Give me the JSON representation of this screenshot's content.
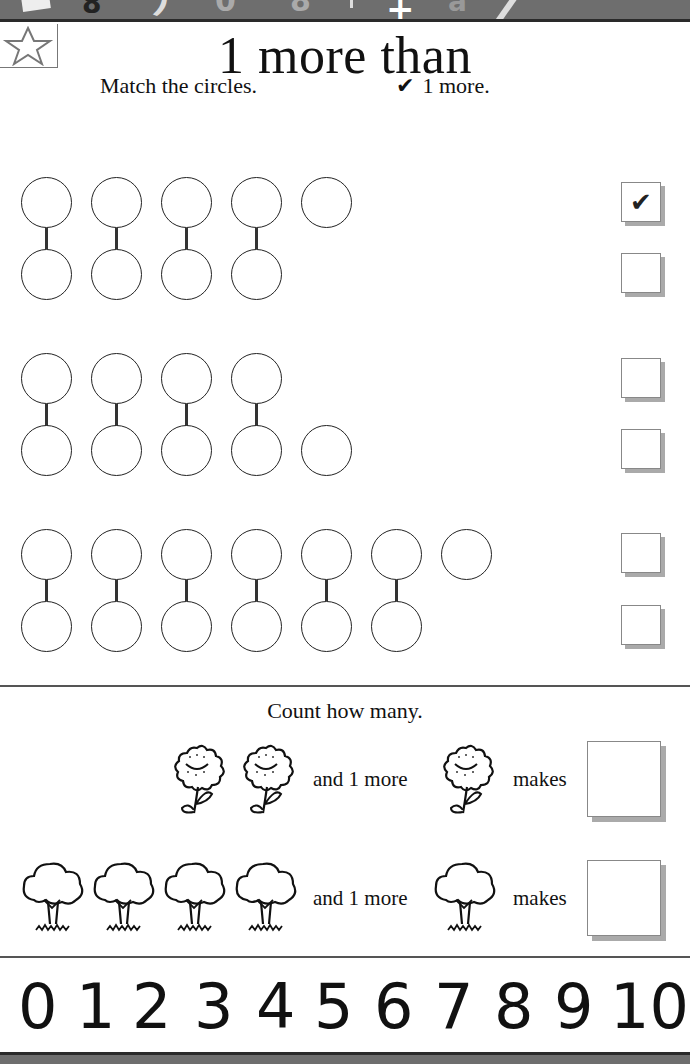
{
  "header": {
    "title": "1 more than",
    "instruction_left": "Match the circles.",
    "instruction_right_icon": "✔",
    "instruction_right": "1 more."
  },
  "colors": {
    "band": "#6e6e6e",
    "band_edge": "#2a2a2a",
    "ink": "#111111",
    "shadow": "#aaaaaa"
  },
  "match_sets": [
    {
      "rows": [
        {
          "circles": 5,
          "checked": true,
          "check_mark": "✔"
        },
        {
          "circles": 4,
          "checked": false,
          "check_mark": ""
        }
      ],
      "links": 4
    },
    {
      "rows": [
        {
          "circles": 4,
          "checked": false,
          "check_mark": ""
        },
        {
          "circles": 5,
          "checked": false,
          "check_mark": ""
        }
      ],
      "links": 4
    },
    {
      "rows": [
        {
          "circles": 7,
          "checked": false,
          "check_mark": ""
        },
        {
          "circles": 6,
          "checked": false,
          "check_mark": ""
        }
      ],
      "links": 6
    }
  ],
  "count_section": {
    "title": "Count how many.",
    "rows": [
      {
        "item": "flower-icon",
        "count": 2,
        "and_text": "and 1 more",
        "extra": 1,
        "makes_text": "makes",
        "answer": ""
      },
      {
        "item": "tree-icon",
        "count": 4,
        "and_text": "and 1 more",
        "extra": 1,
        "makes_text": "makes",
        "answer": ""
      }
    ]
  },
  "number_line": [
    "0",
    "1",
    "2",
    "3",
    "4",
    "5",
    "6",
    "7",
    "8",
    "9",
    "10"
  ]
}
